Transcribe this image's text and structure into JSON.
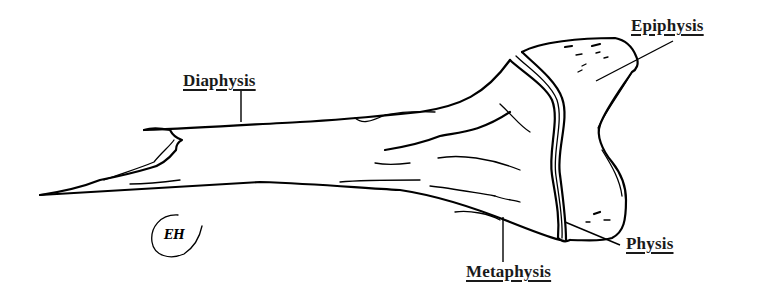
{
  "figure": {
    "labels": {
      "diaphysis": "Diaphysis",
      "epiphysis": "Epiphysis",
      "physis": "Physis",
      "metaphysis": "Metaphysis"
    },
    "signature": "EH",
    "colors": {
      "ink": "#000000",
      "background": "#ffffff",
      "label_text": "#1a1a1a"
    }
  }
}
